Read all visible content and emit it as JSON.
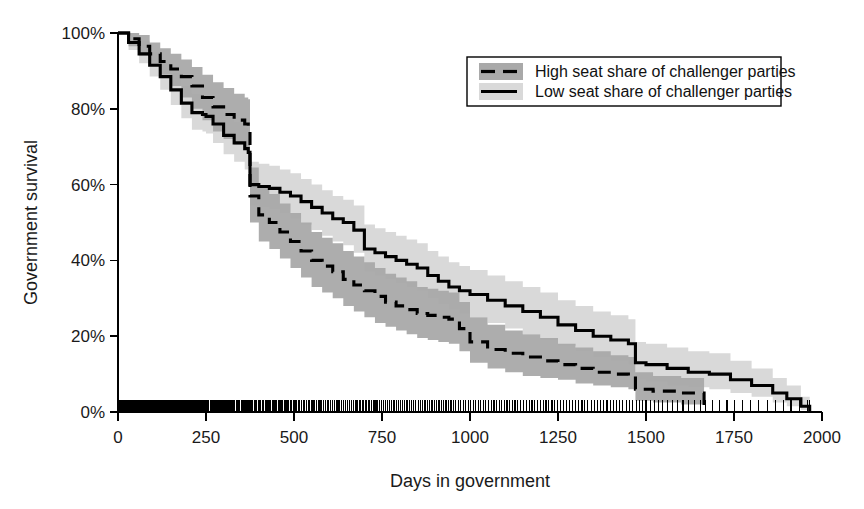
{
  "chart_data": {
    "type": "line",
    "title": "",
    "xlabel": "Days in government",
    "ylabel": "Government survival",
    "xlim": [
      0,
      2000
    ],
    "ylim": [
      0,
      100
    ],
    "grid": false,
    "legend_position": "top-right",
    "xticks": [
      0,
      250,
      500,
      750,
      1000,
      1250,
      1500,
      1750,
      2000
    ],
    "xtick_labels": [
      "0",
      "250",
      "500",
      "750",
      "1000",
      "1250",
      "1500",
      "1750",
      "2000"
    ],
    "yticks": [
      0,
      20,
      40,
      60,
      80,
      100
    ],
    "ytick_labels": [
      "0%",
      "20%",
      "40%",
      "60%",
      "80%",
      "100%"
    ],
    "annotations": [
      "Rug plot of event times along the x-axis at 0%"
    ],
    "series": [
      {
        "name": "High seat share of challenger parties",
        "style": "dashed",
        "band_color": "#a9a9a9",
        "line_color": "#000000",
        "x": [
          0,
          30,
          60,
          90,
          120,
          150,
          180,
          210,
          240,
          270,
          300,
          330,
          360,
          370,
          375,
          400,
          430,
          460,
          490,
          520,
          550,
          580,
          610,
          640,
          670,
          700,
          730,
          760,
          790,
          820,
          850,
          880,
          910,
          940,
          970,
          1000,
          1050,
          1100,
          1150,
          1200,
          1250,
          1300,
          1350,
          1400,
          1450,
          1470,
          1520,
          1600,
          1660,
          1665
        ],
        "y": [
          100,
          98.5,
          96.5,
          94.5,
          92.5,
          90.5,
          88.5,
          86.0,
          83.0,
          80.5,
          78.5,
          77.0,
          76.0,
          75.5,
          57.0,
          52.0,
          50.0,
          47.5,
          45.0,
          42.5,
          40.0,
          38.5,
          37.0,
          35.0,
          33.5,
          32.0,
          30.5,
          29.0,
          28.0,
          27.0,
          26.0,
          25.5,
          25.0,
          24.5,
          22.0,
          18.5,
          16.5,
          15.5,
          14.5,
          13.5,
          12.5,
          11.5,
          10.5,
          10.0,
          9.5,
          6.0,
          5.5,
          5.0,
          5.0,
          0.0
        ],
        "ci_lower": [
          100,
          96.5,
          94.0,
          91.5,
          89.0,
          86.0,
          83.0,
          80.0,
          77.0,
          74.0,
          72.0,
          70.5,
          69.5,
          69.0,
          50.0,
          45.0,
          43.0,
          40.5,
          38.0,
          35.5,
          33.0,
          31.5,
          30.0,
          28.0,
          26.5,
          25.0,
          23.5,
          22.5,
          21.5,
          20.5,
          19.5,
          19.0,
          18.5,
          18.0,
          16.0,
          13.0,
          11.5,
          10.5,
          9.5,
          9.0,
          8.5,
          7.5,
          7.0,
          6.5,
          6.0,
          3.0,
          2.5,
          2.0,
          2.0,
          0.0
        ],
        "ci_upper": [
          100,
          100,
          99.5,
          97.5,
          96.0,
          94.5,
          93.0,
          91.0,
          89.0,
          87.0,
          85.5,
          84.0,
          83.0,
          82.5,
          64.5,
          59.5,
          57.5,
          55.0,
          52.5,
          50.0,
          47.5,
          46.0,
          44.5,
          42.5,
          41.0,
          39.5,
          38.0,
          36.5,
          35.5,
          34.5,
          33.0,
          32.5,
          32.0,
          31.5,
          29.0,
          25.0,
          23.0,
          21.5,
          20.5,
          19.5,
          18.0,
          17.0,
          16.0,
          15.0,
          14.5,
          10.5,
          9.5,
          9.0,
          9.0,
          0.0
        ]
      },
      {
        "name": "Low seat share of challenger parties",
        "style": "solid",
        "band_color": "#d9d9d9",
        "line_color": "#000000",
        "x": [
          0,
          30,
          60,
          90,
          120,
          150,
          180,
          210,
          240,
          250,
          270,
          300,
          330,
          360,
          370,
          375,
          400,
          430,
          460,
          490,
          520,
          550,
          580,
          610,
          640,
          670,
          700,
          730,
          760,
          790,
          820,
          850,
          880,
          910,
          940,
          970,
          1000,
          1050,
          1100,
          1150,
          1200,
          1250,
          1300,
          1350,
          1400,
          1450,
          1470,
          1500,
          1560,
          1620,
          1680,
          1740,
          1800,
          1860,
          1900,
          1940,
          1965
        ],
        "y": [
          100,
          97.5,
          94.5,
          91.5,
          88.5,
          85.0,
          81.5,
          79.0,
          78.5,
          78.0,
          76.0,
          73.0,
          71.0,
          69.5,
          68.5,
          60.0,
          59.5,
          59.0,
          58.0,
          57.0,
          55.5,
          54.0,
          52.5,
          51.0,
          50.0,
          48.0,
          43.0,
          42.0,
          41.0,
          40.0,
          39.0,
          38.0,
          36.0,
          34.5,
          33.0,
          32.0,
          31.0,
          29.5,
          28.0,
          26.5,
          25.0,
          23.0,
          21.5,
          20.0,
          19.0,
          18.0,
          13.0,
          12.5,
          11.5,
          10.5,
          10.0,
          8.5,
          7.0,
          5.0,
          3.5,
          1.5,
          0.0
        ],
        "ci_lower": [
          100,
          95.5,
          92.0,
          88.5,
          85.0,
          81.0,
          77.5,
          74.5,
          74.0,
          73.5,
          71.0,
          68.0,
          66.0,
          64.0,
          63.0,
          54.5,
          54.0,
          53.5,
          52.5,
          51.0,
          49.5,
          48.0,
          46.5,
          45.0,
          44.0,
          42.0,
          37.0,
          36.0,
          35.0,
          34.0,
          33.0,
          32.0,
          30.0,
          28.5,
          27.0,
          26.0,
          25.0,
          23.5,
          22.0,
          20.5,
          19.0,
          17.5,
          16.0,
          14.5,
          13.5,
          12.5,
          8.5,
          8.0,
          7.0,
          6.5,
          6.0,
          5.0,
          4.0,
          2.5,
          1.5,
          0.5,
          0.0
        ],
        "ci_upper": [
          100,
          100,
          98.0,
          95.0,
          92.5,
          89.5,
          86.0,
          84.0,
          83.5,
          83.0,
          81.0,
          78.5,
          76.5,
          75.0,
          74.0,
          66.0,
          65.5,
          65.0,
          64.0,
          63.0,
          61.5,
          60.0,
          58.5,
          57.0,
          56.0,
          54.5,
          49.5,
          48.5,
          47.5,
          46.5,
          45.5,
          44.5,
          42.5,
          41.0,
          39.5,
          38.5,
          37.5,
          36.0,
          34.5,
          33.0,
          31.5,
          29.5,
          28.0,
          26.5,
          25.5,
          24.5,
          18.5,
          18.0,
          17.0,
          16.0,
          15.5,
          13.5,
          11.5,
          9.0,
          7.0,
          4.0,
          0.0
        ]
      }
    ],
    "rug": {
      "label": "event-times",
      "values": [
        5,
        8,
        11,
        14,
        17,
        20,
        22,
        25,
        28,
        31,
        34,
        37,
        40,
        44,
        47,
        50,
        53,
        56,
        58,
        61,
        64,
        67,
        70,
        73,
        76,
        79,
        82,
        85,
        88,
        91,
        94,
        97,
        100,
        104,
        107,
        110,
        113,
        116,
        119,
        122,
        125,
        128,
        131,
        134,
        137,
        140,
        143,
        146,
        150,
        153,
        156,
        159,
        162,
        165,
        168,
        171,
        174,
        177,
        180,
        183,
        186,
        189,
        192,
        196,
        199,
        202,
        205,
        208,
        211,
        214,
        217,
        220,
        224,
        227,
        230,
        233,
        236,
        240,
        243,
        246,
        249,
        252,
        255,
        258,
        262,
        265,
        268,
        271,
        275,
        278,
        281,
        284,
        288,
        291,
        294,
        298,
        301,
        305,
        308,
        311,
        315,
        318,
        322,
        325,
        329,
        332,
        336,
        339,
        343,
        346,
        350,
        354,
        357,
        361,
        364,
        368,
        372,
        375,
        379,
        383,
        387,
        390,
        394,
        398,
        402,
        406,
        410,
        414,
        418,
        422,
        426,
        430,
        434,
        438,
        442,
        446,
        450,
        455,
        459,
        463,
        467,
        472,
        476,
        480,
        485,
        489,
        494,
        498,
        503,
        507,
        512,
        516,
        521,
        526,
        530,
        535,
        540,
        545,
        549,
        554,
        559,
        564,
        569,
        574,
        579,
        584,
        589,
        594,
        599,
        604,
        609,
        615,
        620,
        625,
        630,
        636,
        641,
        646,
        652,
        657,
        663,
        668,
        674,
        679,
        685,
        690,
        696,
        702,
        707,
        713,
        719,
        725,
        730,
        736,
        742,
        748,
        754,
        760,
        766,
        772,
        778,
        784,
        790,
        796,
        802,
        809,
        815,
        821,
        827,
        834,
        840,
        846,
        853,
        859,
        866,
        872,
        879,
        885,
        892,
        899,
        905,
        912,
        919,
        925,
        932,
        939,
        946,
        953,
        960,
        967,
        974,
        981,
        988,
        995,
        1002,
        1009,
        1016,
        1023,
        1031,
        1038,
        1045,
        1053,
        1060,
        1068,
        1075,
        1083,
        1090,
        1098,
        1105,
        1113,
        1121,
        1128,
        1136,
        1144,
        1152,
        1160,
        1168,
        1176,
        1184,
        1192,
        1200,
        1208,
        1216,
        1224,
        1233,
        1241,
        1249,
        1258,
        1266,
        1275,
        1283,
        1292,
        1300,
        1309,
        1318,
        1326,
        1335,
        1344,
        1353,
        1362,
        1371,
        1380,
        1389,
        1398,
        1407,
        1416,
        1425,
        1434,
        1444,
        1453,
        1462,
        1472,
        1481,
        1491,
        1500,
        1512,
        1524,
        1536,
        1548,
        1560,
        1575,
        1590,
        1605,
        1620,
        1638,
        1656,
        1670,
        1690,
        1710,
        1730,
        1752,
        1775,
        1798,
        1820,
        1845,
        1868,
        1890,
        1912,
        1935,
        1958,
        1965
      ]
    }
  },
  "legend": {
    "items": [
      {
        "label": "High seat share of challenger parties",
        "style": "dashed",
        "swatch": "#a9a9a9"
      },
      {
        "label": "Low seat share of challenger parties",
        "style": "solid",
        "swatch": "#d9d9d9"
      }
    ]
  }
}
